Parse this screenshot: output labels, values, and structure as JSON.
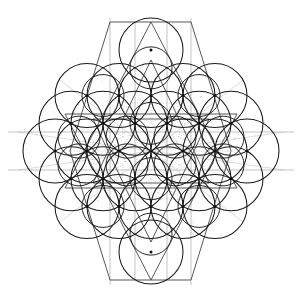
{
  "figure": {
    "type": "sacred-geometry-construction",
    "canvas": {
      "width": 302,
      "height": 302,
      "background": "#ffffff"
    }
  },
  "palette": {
    "background": "#ffffff",
    "circle_stroke": "#1a1a1a",
    "inner_circle_stroke": "#1f1f1f",
    "star_line_stroke": "#3a3a3a",
    "grid_line_stroke": "#9a9a9a",
    "faint_line_stroke": "#b8b8b8",
    "dotted_line_stroke": "#9e9e9e",
    "node_fill": "#111111"
  },
  "geometry": {
    "center": {
      "x": 151,
      "y": 151
    },
    "circle_radius": 32,
    "inner_circle_radius": 21,
    "lattice_spacing": 32,
    "lattice_type": "triangular-hexagonal",
    "ring_counts": [
      1,
      6,
      12,
      18
    ],
    "extent": {
      "min_x": 18,
      "max_x": 284,
      "min_y": 18,
      "max_y": 285
    }
  },
  "lattice_nodes": [
    {
      "x": 151,
      "y": 151,
      "ring": 0,
      "has_circle": false
    },
    {
      "x": 183,
      "y": 151,
      "ring": 1,
      "has_circle": true
    },
    {
      "x": 167,
      "y": 123.29,
      "ring": 1,
      "has_circle": true
    },
    {
      "x": 135,
      "y": 123.29,
      "ring": 1,
      "has_circle": true
    },
    {
      "x": 119,
      "y": 151,
      "ring": 1,
      "has_circle": true
    },
    {
      "x": 135,
      "y": 178.71,
      "ring": 1,
      "has_circle": true
    },
    {
      "x": 167,
      "y": 178.71,
      "ring": 1,
      "has_circle": true
    },
    {
      "x": 215,
      "y": 151,
      "ring": 2,
      "has_circle": true
    },
    {
      "x": 199,
      "y": 123.29,
      "ring": 2,
      "has_circle": true
    },
    {
      "x": 183,
      "y": 95.57,
      "ring": 2,
      "has_circle": true
    },
    {
      "x": 151,
      "y": 95.57,
      "ring": 2,
      "has_circle": true
    },
    {
      "x": 119,
      "y": 95.57,
      "ring": 2,
      "has_circle": true
    },
    {
      "x": 103,
      "y": 123.29,
      "ring": 2,
      "has_circle": true
    },
    {
      "x": 87,
      "y": 151,
      "ring": 2,
      "has_circle": true
    },
    {
      "x": 103,
      "y": 178.71,
      "ring": 2,
      "has_circle": true
    },
    {
      "x": 119,
      "y": 206.43,
      "ring": 2,
      "has_circle": true
    },
    {
      "x": 151,
      "y": 206.43,
      "ring": 2,
      "has_circle": true
    },
    {
      "x": 183,
      "y": 206.43,
      "ring": 2,
      "has_circle": true
    },
    {
      "x": 199,
      "y": 178.71,
      "ring": 2,
      "has_circle": true
    },
    {
      "x": 151,
      "y": 50,
      "ring": 3,
      "has_circle": true
    },
    {
      "x": 215,
      "y": 95.57,
      "ring": 3,
      "has_circle": true
    },
    {
      "x": 247,
      "y": 151,
      "ring": 3,
      "has_circle": true
    },
    {
      "x": 215,
      "y": 206.43,
      "ring": 3,
      "has_circle": true
    },
    {
      "x": 151,
      "y": 252,
      "ring": 3,
      "has_circle": true
    },
    {
      "x": 87,
      "y": 206.43,
      "ring": 3,
      "has_circle": true
    },
    {
      "x": 55,
      "y": 151,
      "ring": 3,
      "has_circle": true
    },
    {
      "x": 87,
      "y": 95.57,
      "ring": 3,
      "has_circle": true
    },
    {
      "x": 231,
      "y": 123.29,
      "ring": 3,
      "has_circle": true
    },
    {
      "x": 231,
      "y": 178.71,
      "ring": 3,
      "has_circle": true
    },
    {
      "x": 71,
      "y": 123.29,
      "ring": 3,
      "has_circle": true
    },
    {
      "x": 71,
      "y": 178.71,
      "ring": 3,
      "has_circle": true
    }
  ],
  "inner_circles": [
    {
      "x": 151,
      "y": 123.29
    },
    {
      "x": 175,
      "y": 137.15
    },
    {
      "x": 175,
      "y": 164.86
    },
    {
      "x": 151,
      "y": 178.71
    },
    {
      "x": 127,
      "y": 164.86
    },
    {
      "x": 127,
      "y": 137.15
    },
    {
      "x": 151,
      "y": 67.86
    },
    {
      "x": 199,
      "y": 95.57
    },
    {
      "x": 223,
      "y": 137.15
    },
    {
      "x": 223,
      "y": 164.86
    },
    {
      "x": 199,
      "y": 206.43
    },
    {
      "x": 151,
      "y": 234.14
    },
    {
      "x": 103,
      "y": 206.43
    },
    {
      "x": 79,
      "y": 164.86
    },
    {
      "x": 79,
      "y": 137.15
    },
    {
      "x": 103,
      "y": 95.57
    }
  ],
  "star_polygons": [
    {
      "name": "outer-hexagram-a",
      "points": "151,22 237,188 65,188",
      "closed": true
    },
    {
      "name": "outer-hexagram-b",
      "points": "151,280 65,114 237,114",
      "closed": true
    },
    {
      "name": "inner-hexagram-a",
      "points": "151,60 209,183 93,183",
      "closed": true
    },
    {
      "name": "inner-hexagram-b",
      "points": "151,242 93,119 209,119",
      "closed": true
    },
    {
      "name": "spike-star-a",
      "points": "110,22 191,22 231,151 191,280 110,280 70,151",
      "closed": true
    }
  ],
  "grid_lines": [
    {
      "name": "horizontal-upper",
      "x1": 8,
      "y1": 132,
      "x2": 294,
      "y2": 132
    },
    {
      "name": "horizontal-lower",
      "x1": 8,
      "y1": 170,
      "x2": 294,
      "y2": 170
    },
    {
      "name": "vertical-left",
      "x1": 110,
      "y1": 18,
      "x2": 110,
      "y2": 285
    },
    {
      "name": "vertical-right",
      "x1": 191,
      "y1": 18,
      "x2": 191,
      "y2": 285
    },
    {
      "name": "vertical-center-l",
      "x1": 135,
      "y1": 22,
      "x2": 135,
      "y2": 280
    },
    {
      "name": "vertical-center-r",
      "x1": 167,
      "y1": 22,
      "x2": 167,
      "y2": 280
    }
  ],
  "faint_lines": [
    {
      "name": "diag-a",
      "x1": 18,
      "y1": 170,
      "x2": 284,
      "y2": 132
    },
    {
      "name": "diag-b",
      "x1": 18,
      "y1": 132,
      "x2": 284,
      "y2": 170
    },
    {
      "name": "diag-c",
      "x1": 60,
      "y1": 80,
      "x2": 243,
      "y2": 222
    },
    {
      "name": "diag-d",
      "x1": 60,
      "y1": 222,
      "x2": 243,
      "y2": 80
    }
  ],
  "accessibility": {
    "alt_text": "Black line drawing of a flower-of-life mandala: nineteen-plus overlapping circles in a hexagonal grid crossed by straight star-polygon lines, on a white background.",
    "caption": "Sacred geometry construction drawing"
  }
}
